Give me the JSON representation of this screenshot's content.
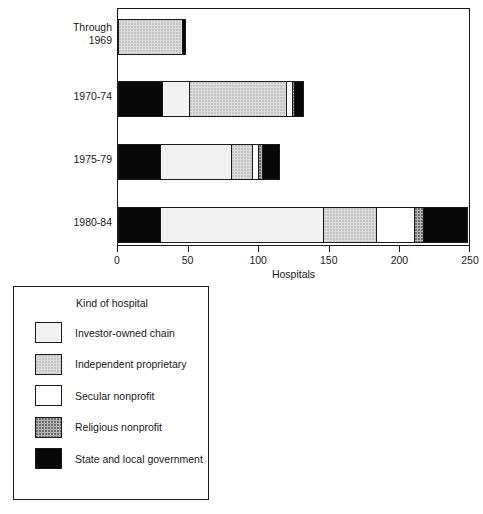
{
  "chart_data": {
    "type": "bar",
    "subtype": "horizontal-stacked",
    "title": "",
    "xlabel": "Hospitals",
    "ylabel": "",
    "xlim": [
      0,
      250
    ],
    "xticks": [
      0,
      50,
      100,
      150,
      200,
      250
    ],
    "xtick_labels": [
      "0",
      "50",
      "100",
      "150",
      "200",
      "250"
    ],
    "grid": false,
    "legend_position": "below-left",
    "legend_title": "Kind of hospital",
    "categories": [
      "Through 1969",
      "1970-74",
      "1975-79",
      "1980-84"
    ],
    "series": [
      {
        "name": "State and local government",
        "color": "#080808",
        "pattern": "solid-black",
        "values": [
          0,
          31,
          30,
          30
        ]
      },
      {
        "name": "Investor-owned chain",
        "color": "#f2f2f2",
        "pattern": "very-light",
        "values": [
          0,
          19,
          50,
          81
        ]
      },
      {
        "name": "Independent proprietary",
        "color": "#dcdcdc",
        "pattern": "light-stipple",
        "values": [
          45,
          69,
          15,
          27
        ]
      },
      {
        "name": "Secular nonprofit",
        "color": "#ffffff",
        "pattern": "white",
        "values": [
          0,
          4,
          4,
          19
        ]
      },
      {
        "name": "Religious nonprofit",
        "color": "#b4b4b4",
        "pattern": "medium-stipple",
        "values": [
          0,
          2,
          3,
          5
        ]
      },
      {
        "name": "State and local government (tail)",
        "color": "#080808",
        "pattern": "solid-black",
        "values": [
          3,
          7,
          13,
          22
        ]
      }
    ],
    "bars": [
      {
        "category": "Through 1969",
        "total": 48,
        "segments": [
          {
            "kind": "Independent proprietary",
            "value": 45,
            "start": 0,
            "end": 45
          },
          {
            "kind": "State and local government",
            "value": 3,
            "start": 45,
            "end": 48
          }
        ]
      },
      {
        "category": "1970-74",
        "total": 132,
        "segments": [
          {
            "kind": "State and local government",
            "value": 31,
            "start": 0,
            "end": 31
          },
          {
            "kind": "Investor-owned chain",
            "value": 19,
            "start": 31,
            "end": 50
          },
          {
            "kind": "Independent proprietary",
            "value": 69,
            "start": 50,
            "end": 119
          },
          {
            "kind": "Secular nonprofit",
            "value": 4,
            "start": 119,
            "end": 123
          },
          {
            "kind": "Religious nonprofit",
            "value": 2,
            "start": 123,
            "end": 125
          },
          {
            "kind": "State and local government",
            "value": 7,
            "start": 125,
            "end": 132
          }
        ]
      },
      {
        "category": "1975-79",
        "total": 115,
        "segments": [
          {
            "kind": "State and local government",
            "value": 30,
            "start": 0,
            "end": 30
          },
          {
            "kind": "Investor-owned chain",
            "value": 50,
            "start": 30,
            "end": 80
          },
          {
            "kind": "Independent proprietary",
            "value": 15,
            "start": 80,
            "end": 95
          },
          {
            "kind": "Secular nonprofit",
            "value": 4,
            "start": 95,
            "end": 99
          },
          {
            "kind": "Religious nonprofit",
            "value": 3,
            "start": 99,
            "end": 102
          },
          {
            "kind": "State and local government",
            "value": 13,
            "start": 102,
            "end": 115
          }
        ]
      },
      {
        "category": "1980-84",
        "total": 248,
        "segments": [
          {
            "kind": "State and local government",
            "value": 30,
            "start": 0,
            "end": 30
          },
          {
            "kind": "Investor-owned chain",
            "value": 115,
            "start": 30,
            "end": 145
          },
          {
            "kind": "Independent proprietary",
            "value": 38,
            "start": 145,
            "end": 183
          },
          {
            "kind": "Secular nonprofit",
            "value": 27,
            "start": 183,
            "end": 210
          },
          {
            "kind": "Religious nonprofit",
            "value": 6,
            "start": 210,
            "end": 216
          },
          {
            "kind": "State and local government",
            "value": 32,
            "start": 216,
            "end": 248
          }
        ]
      }
    ]
  },
  "axis": {
    "x_title": "Hospitals",
    "tick_labels": [
      "0",
      "50",
      "100",
      "150",
      "200",
      "250"
    ]
  },
  "category_labels": [
    "Through\n1969",
    "1970-74",
    "1975-79",
    "1980-84"
  ],
  "legend": {
    "title": "Kind of hospital",
    "items": [
      {
        "label": "Investor-owned chain",
        "fill_class": "fill-investor",
        "color": "#f2f2f2"
      },
      {
        "label": "Independent proprietary",
        "fill_class": "fill-independent",
        "color": "#dcdcdc"
      },
      {
        "label": "Secular nonprofit",
        "fill_class": "fill-secular",
        "color": "#ffffff"
      },
      {
        "label": "Religious nonprofit",
        "fill_class": "fill-religious",
        "color": "#b4b4b4"
      },
      {
        "label": "State and local government",
        "fill_class": "fill-state",
        "color": "#080808"
      }
    ]
  }
}
